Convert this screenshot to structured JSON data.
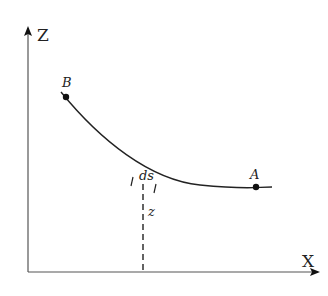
{
  "diagram": {
    "type": "curve-in-xz-plane",
    "axes": {
      "vertical_label": "Z",
      "horizontal_label": "X"
    },
    "points": [
      {
        "id": "B",
        "label": "B",
        "x": 66,
        "y": 97
      },
      {
        "id": "A",
        "label": "A",
        "x": 256,
        "y": 187
      }
    ],
    "arc_element_label": "ds",
    "height_label": "z",
    "colors": {
      "ink": "#222222",
      "axis": "#555555",
      "background": "#ffffff"
    }
  }
}
